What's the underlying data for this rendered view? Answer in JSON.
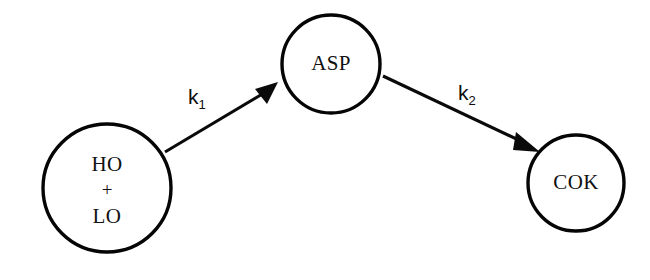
{
  "diagram": {
    "type": "reaction-scheme",
    "background_color": "#ffffff",
    "stroke_color": "#0a0a0a",
    "nodes": [
      {
        "id": "reactants",
        "lines": [
          "HO",
          "+",
          "LO"
        ],
        "line1": "HO",
        "operator": "+",
        "line3": "LO",
        "cx": 107,
        "cy": 188,
        "r": 64
      },
      {
        "id": "asp",
        "label": "ASP",
        "cx": 331,
        "cy": 64,
        "r": 49
      },
      {
        "id": "cok",
        "label": "COK",
        "cx": 576,
        "cy": 183,
        "r": 48
      }
    ],
    "arrows": [
      {
        "id": "arrow-k1",
        "from": "reactants",
        "to": "asp",
        "label_base": "k",
        "label_sub": "1",
        "label_full": "k1"
      },
      {
        "id": "arrow-k2",
        "from": "asp",
        "to": "cok",
        "label_base": "k",
        "label_sub": "2",
        "label_full": "k2"
      }
    ]
  }
}
